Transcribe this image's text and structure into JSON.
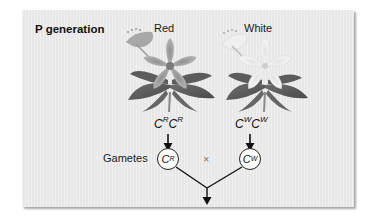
{
  "panel": {
    "title": "P generation",
    "background_color": "#ebebeb"
  },
  "parents": [
    {
      "label": "Red",
      "flower_icon": "red-flower-icon",
      "genotype": {
        "allele1": "C",
        "sup1": "R",
        "allele2": "C",
        "sup2": "R"
      },
      "gamete": {
        "allele": "C",
        "sup": "R"
      }
    },
    {
      "label": "White",
      "flower_icon": "white-flower-icon",
      "genotype": {
        "allele1": "C",
        "sup1": "W",
        "allele2": "C",
        "sup2": "W"
      },
      "gamete": {
        "allele": "C",
        "sup": "W"
      }
    }
  ],
  "gametes_label": "Gametes",
  "cross_symbol": "×"
}
